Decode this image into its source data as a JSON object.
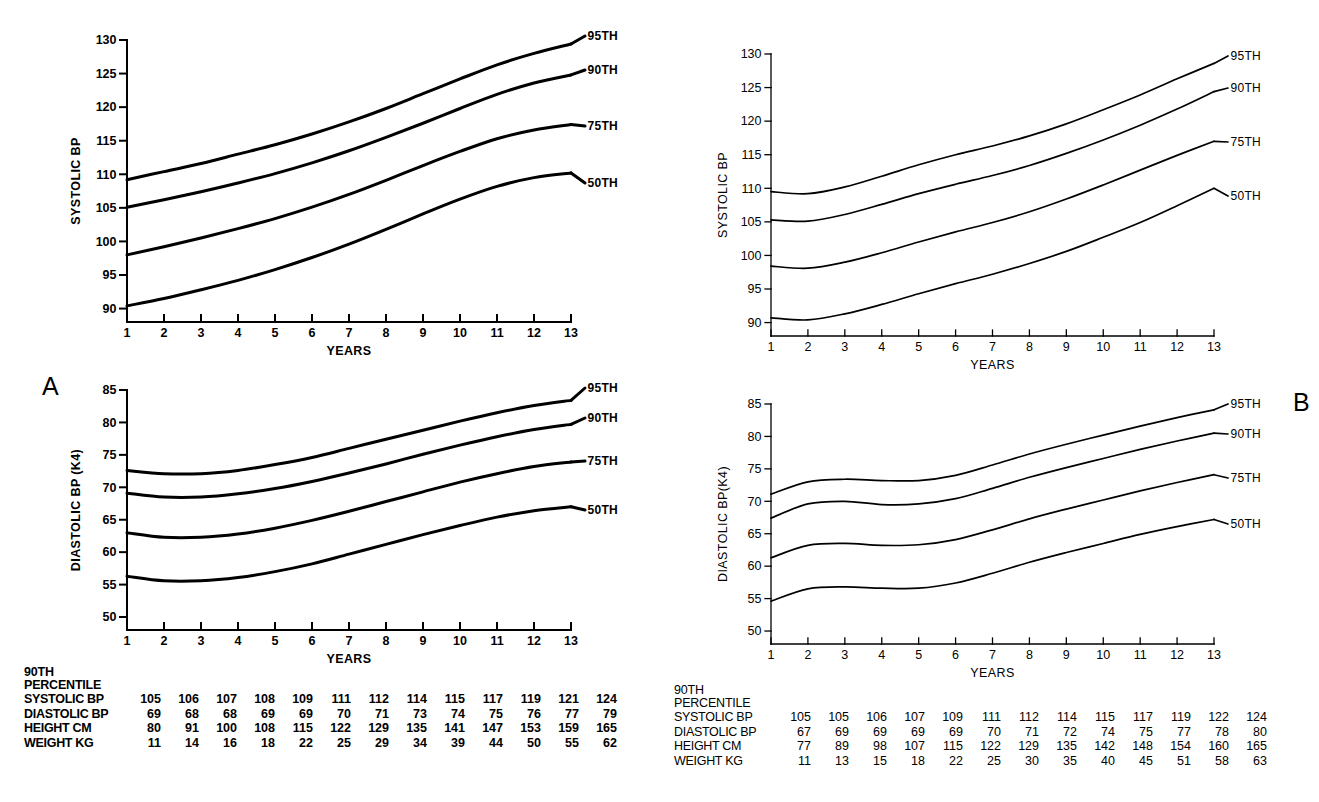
{
  "figure": {
    "panels": [
      {
        "letter": "A",
        "charts": [
          {
            "ylabel": "SYSTOLIC BP",
            "xlabel": "YEARS",
            "yticks": [
              "90",
              "95",
              "100",
              "105",
              "110",
              "115",
              "120",
              "125",
              "130"
            ],
            "xticks": [
              "1",
              "2",
              "3",
              "4",
              "5",
              "6",
              "7",
              "8",
              "9",
              "10",
              "11",
              "12",
              "13"
            ],
            "curve_labels": [
              "95TH",
              "90TH",
              "75TH",
              "50TH"
            ]
          },
          {
            "ylabel": "DIASTOLIC BP (K4)",
            "xlabel": "YEARS",
            "yticks": [
              "50",
              "55",
              "60",
              "65",
              "70",
              "75",
              "80",
              "85"
            ],
            "xticks": [
              "1",
              "2",
              "3",
              "4",
              "5",
              "6",
              "7",
              "8",
              "9",
              "10",
              "11",
              "12",
              "13"
            ],
            "curve_labels": [
              "95TH",
              "90TH",
              "75TH",
              "50TH"
            ]
          }
        ],
        "table": {
          "header_line1": "90TH",
          "header_line2": "PERCENTILE",
          "rows": [
            {
              "label": "SYSTOLIC BP",
              "values": [
                "105",
                "106",
                "107",
                "108",
                "109",
                "111",
                "112",
                "114",
                "115",
                "117",
                "119",
                "121",
                "124"
              ]
            },
            {
              "label": "DIASTOLIC BP",
              "values": [
                "69",
                "68",
                "68",
                "69",
                "69",
                "70",
                "71",
                "73",
                "74",
                "75",
                "76",
                "77",
                "79"
              ]
            },
            {
              "label": "HEIGHT CM",
              "values": [
                "80",
                "91",
                "100",
                "108",
                "115",
                "122",
                "129",
                "135",
                "141",
                "147",
                "153",
                "159",
                "165"
              ]
            },
            {
              "label": "WEIGHT KG",
              "values": [
                "11",
                "14",
                "16",
                "18",
                "22",
                "25",
                "29",
                "34",
                "39",
                "44",
                "50",
                "55",
                "62"
              ]
            }
          ]
        }
      },
      {
        "letter": "B",
        "charts": [
          {
            "ylabel": "SYSTOLIC BP",
            "xlabel": "YEARS",
            "yticks": [
              "90",
              "95",
              "100",
              "105",
              "110",
              "115",
              "120",
              "125",
              "130"
            ],
            "xticks": [
              "1",
              "2",
              "3",
              "4",
              "5",
              "6",
              "7",
              "8",
              "9",
              "10",
              "11",
              "12",
              "13"
            ],
            "curve_labels": [
              "95TH",
              "90TH",
              "75TH",
              "50TH"
            ]
          },
          {
            "ylabel": "DIASTOLIC BP(K4)",
            "xlabel": "YEARS",
            "yticks": [
              "50",
              "55",
              "60",
              "65",
              "70",
              "75",
              "80",
              "85"
            ],
            "xticks": [
              "1",
              "2",
              "3",
              "4",
              "5",
              "6",
              "7",
              "8",
              "9",
              "10",
              "11",
              "12",
              "13"
            ],
            "curve_labels": [
              "95TH",
              "90TH",
              "75TH",
              "50TH"
            ]
          }
        ],
        "table": {
          "header_line1": "90TH",
          "header_line2": "PERCENTILE",
          "rows": [
            {
              "label": "SYSTOLIC BP",
              "values": [
                "105",
                "105",
                "106",
                "107",
                "109",
                "111",
                "112",
                "114",
                "115",
                "117",
                "119",
                "122",
                "124"
              ]
            },
            {
              "label": "DIASTOLIC BP",
              "values": [
                "67",
                "69",
                "69",
                "69",
                "69",
                "70",
                "71",
                "72",
                "74",
                "75",
                "77",
                "78",
                "80"
              ]
            },
            {
              "label": "HEIGHT CM",
              "values": [
                "77",
                "89",
                "98",
                "107",
                "115",
                "122",
                "129",
                "135",
                "142",
                "148",
                "154",
                "160",
                "165"
              ]
            },
            {
              "label": "WEIGHT KG",
              "values": [
                "11",
                "13",
                "15",
                "18",
                "22",
                "25",
                "30",
                "35",
                "40",
                "45",
                "51",
                "58",
                "63"
              ]
            }
          ]
        }
      }
    ]
  },
  "chart_data": [
    {
      "type": "line",
      "panel": "A",
      "title": "Systolic BP percentiles, boys age 1-13 (Panel A)",
      "xlabel": "YEARS",
      "ylabel": "SYSTOLIC BP",
      "xlim": [
        1,
        13
      ],
      "ylim": [
        88,
        130
      ],
      "grid": false,
      "x": [
        1,
        2,
        3,
        4,
        5,
        6,
        7,
        8,
        9,
        10,
        11,
        12,
        13
      ],
      "series": [
        {
          "name": "95TH",
          "values": [
            109.2,
            110.4,
            111.6,
            113.0,
            114.4,
            116.0,
            117.8,
            119.8,
            122.0,
            124.2,
            126.3,
            128.0,
            129.4
          ]
        },
        {
          "name": "90TH",
          "values": [
            105.1,
            106.2,
            107.4,
            108.7,
            110.1,
            111.7,
            113.5,
            115.5,
            117.6,
            119.8,
            121.9,
            123.6,
            124.8
          ]
        },
        {
          "name": "75TH",
          "values": [
            98.0,
            99.2,
            100.5,
            101.9,
            103.4,
            105.1,
            107.0,
            109.1,
            111.3,
            113.4,
            115.3,
            116.6,
            117.4
          ]
        },
        {
          "name": "50TH",
          "values": [
            90.4,
            91.5,
            92.8,
            94.2,
            95.8,
            97.6,
            99.6,
            101.8,
            104.1,
            106.3,
            108.2,
            109.5,
            110.2
          ]
        }
      ],
      "annotations": [
        "95TH",
        "90TH",
        "75TH",
        "50TH"
      ]
    },
    {
      "type": "line",
      "panel": "A",
      "title": "Diastolic BP (K4) percentiles, boys age 1-13 (Panel A)",
      "xlabel": "YEARS",
      "ylabel": "DIASTOLIC BP (K4)",
      "xlim": [
        1,
        13
      ],
      "ylim": [
        48,
        85
      ],
      "grid": false,
      "x": [
        1,
        2,
        3,
        4,
        5,
        6,
        7,
        8,
        9,
        10,
        11,
        12,
        13
      ],
      "series": [
        {
          "name": "95TH",
          "values": [
            72.6,
            72.1,
            72.1,
            72.6,
            73.5,
            74.6,
            76.0,
            77.4,
            78.8,
            80.2,
            81.5,
            82.6,
            83.4
          ]
        },
        {
          "name": "90TH",
          "values": [
            69.1,
            68.5,
            68.5,
            69.0,
            69.8,
            70.9,
            72.2,
            73.6,
            75.1,
            76.5,
            77.8,
            78.9,
            79.7
          ]
        },
        {
          "name": "75TH",
          "values": [
            63.0,
            62.3,
            62.3,
            62.8,
            63.7,
            64.9,
            66.3,
            67.8,
            69.3,
            70.8,
            72.1,
            73.2,
            73.9
          ]
        },
        {
          "name": "50TH",
          "values": [
            56.3,
            55.6,
            55.6,
            56.1,
            57.0,
            58.2,
            59.7,
            61.2,
            62.7,
            64.1,
            65.4,
            66.4,
            67.0
          ]
        }
      ],
      "annotations": [
        "95TH",
        "90TH",
        "75TH",
        "50TH"
      ]
    },
    {
      "type": "line",
      "panel": "B",
      "title": "Systolic BP percentiles, girls age 1-13 (Panel B)",
      "xlabel": "YEARS",
      "ylabel": "SYSTOLIC BP",
      "xlim": [
        1,
        13
      ],
      "ylim": [
        88,
        130
      ],
      "grid": false,
      "x": [
        1,
        2,
        3,
        4,
        5,
        6,
        7,
        8,
        9,
        10,
        11,
        12,
        13
      ],
      "series": [
        {
          "name": "95TH",
          "values": [
            109.5,
            109.2,
            110.2,
            111.8,
            113.5,
            115.0,
            116.3,
            117.8,
            119.6,
            121.7,
            123.9,
            126.3,
            128.6
          ]
        },
        {
          "name": "90TH",
          "values": [
            105.3,
            105.1,
            106.1,
            107.6,
            109.2,
            110.6,
            111.9,
            113.4,
            115.2,
            117.2,
            119.4,
            121.8,
            124.4
          ]
        },
        {
          "name": "75TH",
          "values": [
            98.4,
            98.1,
            99.0,
            100.4,
            102.0,
            103.5,
            104.9,
            106.5,
            108.4,
            110.5,
            112.7,
            114.9,
            117.0
          ]
        },
        {
          "name": "50TH",
          "values": [
            90.7,
            90.4,
            91.3,
            92.7,
            94.3,
            95.8,
            97.2,
            98.8,
            100.6,
            102.7,
            104.9,
            107.4,
            110.0
          ]
        }
      ],
      "annotations": [
        "95TH",
        "90TH",
        "75TH",
        "50TH"
      ]
    },
    {
      "type": "line",
      "panel": "B",
      "title": "Diastolic BP (K4) percentiles, girls age 1-13 (Panel B)",
      "xlabel": "YEARS",
      "ylabel": "DIASTOLIC BP(K4)",
      "xlim": [
        1,
        13
      ],
      "ylim": [
        48,
        85
      ],
      "grid": false,
      "x": [
        1,
        2,
        3,
        4,
        5,
        6,
        7,
        8,
        9,
        10,
        11,
        12,
        13
      ],
      "series": [
        {
          "name": "95TH",
          "values": [
            71.1,
            73.0,
            73.4,
            73.2,
            73.2,
            74.0,
            75.6,
            77.3,
            78.8,
            80.2,
            81.6,
            82.9,
            84.1
          ]
        },
        {
          "name": "90TH",
          "values": [
            67.4,
            69.6,
            70.0,
            69.5,
            69.6,
            70.4,
            72.0,
            73.7,
            75.2,
            76.6,
            78.0,
            79.3,
            80.5
          ]
        },
        {
          "name": "75TH",
          "values": [
            61.3,
            63.2,
            63.5,
            63.2,
            63.3,
            64.1,
            65.6,
            67.3,
            68.8,
            70.2,
            71.6,
            72.9,
            74.1
          ]
        },
        {
          "name": "50TH",
          "values": [
            54.6,
            56.5,
            56.8,
            56.6,
            56.6,
            57.4,
            58.9,
            60.6,
            62.1,
            63.5,
            64.9,
            66.1,
            67.2
          ]
        }
      ],
      "annotations": [
        "95TH",
        "90TH",
        "75TH",
        "50TH"
      ]
    }
  ]
}
